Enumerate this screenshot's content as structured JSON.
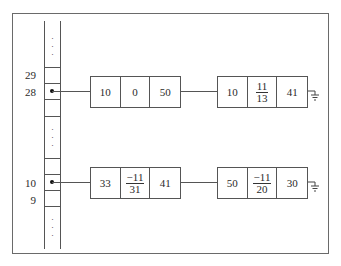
{
  "diagram": {
    "type": "hash-table-with-chained-lists",
    "table": {
      "labels": [
        {
          "index": "29",
          "row": "row-29"
        },
        {
          "index": "28",
          "row": "row-28"
        },
        {
          "index": "10",
          "row": "row-10"
        },
        {
          "index": "9",
          "row": "row-9"
        }
      ],
      "ellipsis": "⋮"
    },
    "chains": [
      {
        "from_index": "28",
        "nodes": [
          {
            "cells": [
              {
                "text": "10"
              },
              {
                "text": "0"
              },
              {
                "text": "50"
              }
            ]
          },
          {
            "cells": [
              {
                "text": "10"
              },
              {
                "num": "11",
                "den": "13"
              },
              {
                "text": "41"
              }
            ]
          }
        ],
        "terminator": "ground-null"
      },
      {
        "from_index": "10",
        "nodes": [
          {
            "cells": [
              {
                "text": "33"
              },
              {
                "num": "−11",
                "den": "31"
              },
              {
                "text": "41"
              }
            ]
          },
          {
            "cells": [
              {
                "text": "50"
              },
              {
                "num": "−11",
                "den": "20"
              },
              {
                "text": "30"
              }
            ]
          }
        ],
        "terminator": "ground-null"
      }
    ]
  }
}
